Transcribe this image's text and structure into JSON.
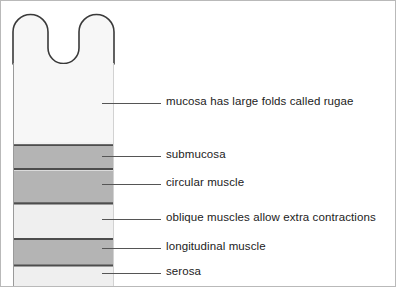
{
  "diagram": {
    "canvas": {
      "width": 396,
      "height": 287
    },
    "colors": {
      "background": "#ffffff",
      "frame_border": "#b9b9b9",
      "outline": "#3a3a3a",
      "band_dark": "#b4b4b4",
      "band_light": "#efefef",
      "band_pale": "#f2f2f2",
      "separator": "#4d4d4d",
      "leader_line": "#555555",
      "text": "#222222"
    },
    "wall": {
      "left": 12,
      "right": 113,
      "top": 14,
      "bottom": 286,
      "rugae_fold_count": 3,
      "rugae_fold_top_y": 16,
      "rugae_valley_y": 63
    },
    "layers": [
      {
        "id": "mucosa",
        "name": "mucosa",
        "fill": "#f7f7f7",
        "y_top": 63,
        "y_bottom": 141,
        "has_top_separator": false
      },
      {
        "id": "submucosa",
        "name": "submucosa",
        "fill": "#b4b4b4",
        "y_top": 145,
        "y_bottom": 167,
        "has_top_separator": true
      },
      {
        "id": "circular-muscle",
        "name": "circular muscle",
        "fill": "#b4b4b4",
        "y_top": 170,
        "y_bottom": 203,
        "has_top_separator": true
      },
      {
        "id": "oblique-muscles",
        "name": "oblique muscles",
        "fill": "#efefef",
        "y_top": 203,
        "y_bottom": 236,
        "has_top_separator": true
      },
      {
        "id": "longitudinal-muscle",
        "name": "longitudinal muscle",
        "fill": "#b4b4b4",
        "y_top": 239,
        "y_bottom": 265,
        "has_top_separator": true
      },
      {
        "id": "serosa",
        "name": "serosa",
        "fill": "#efefef",
        "y_top": 268,
        "y_bottom": 286,
        "has_top_separator": true
      }
    ],
    "labels": [
      {
        "id": "mucosa",
        "text": "mucosa has large folds called rugae",
        "leader_x_start": 101,
        "leader_x_end": 160,
        "leader_y": 102,
        "text_y": 96
      },
      {
        "id": "submucosa",
        "text": "submucosa",
        "leader_x_start": 101,
        "leader_x_end": 160,
        "leader_y": 155,
        "text_y": 149
      },
      {
        "id": "circular-muscle",
        "text": "circular muscle",
        "leader_x_start": 101,
        "leader_x_end": 160,
        "leader_y": 183,
        "text_y": 177
      },
      {
        "id": "oblique-muscles",
        "text": "oblique muscles allow extra contractions",
        "leader_x_start": 101,
        "leader_x_end": 160,
        "leader_y": 218,
        "text_y": 212
      },
      {
        "id": "longitudinal-muscle",
        "text": "longitudinal muscle",
        "leader_x_start": 101,
        "leader_x_end": 160,
        "leader_y": 247,
        "text_y": 241
      },
      {
        "id": "serosa",
        "text": "serosa",
        "leader_x_start": 101,
        "leader_x_end": 160,
        "leader_y": 272,
        "text_y": 266
      }
    ]
  }
}
